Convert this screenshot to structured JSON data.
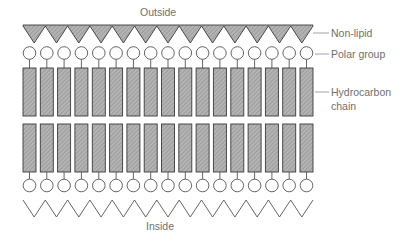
{
  "diagram": {
    "labels": {
      "outside": "Outside",
      "inside": "Inside",
      "non_lipid": "Non-lipid",
      "polar_group": "Polar group",
      "hydrocarbon_line1": "Hydrocarbon",
      "hydrocarbon_line2": "chain"
    },
    "structure": {
      "lipid_columns": 17,
      "layers": [
        "outer polar groups",
        "outer hydrocarbon chains",
        "inner hydrocarbon chains",
        "inner polar groups"
      ],
      "top_zigzag_teeth": 13,
      "bottom_zigzag_teeth": 13
    },
    "colors": {
      "hatch_fill": "#a8a8a8",
      "outline": "#3a3a3a",
      "label_text": "#6f6f6f",
      "leader_line": "#8a8a8a"
    }
  }
}
